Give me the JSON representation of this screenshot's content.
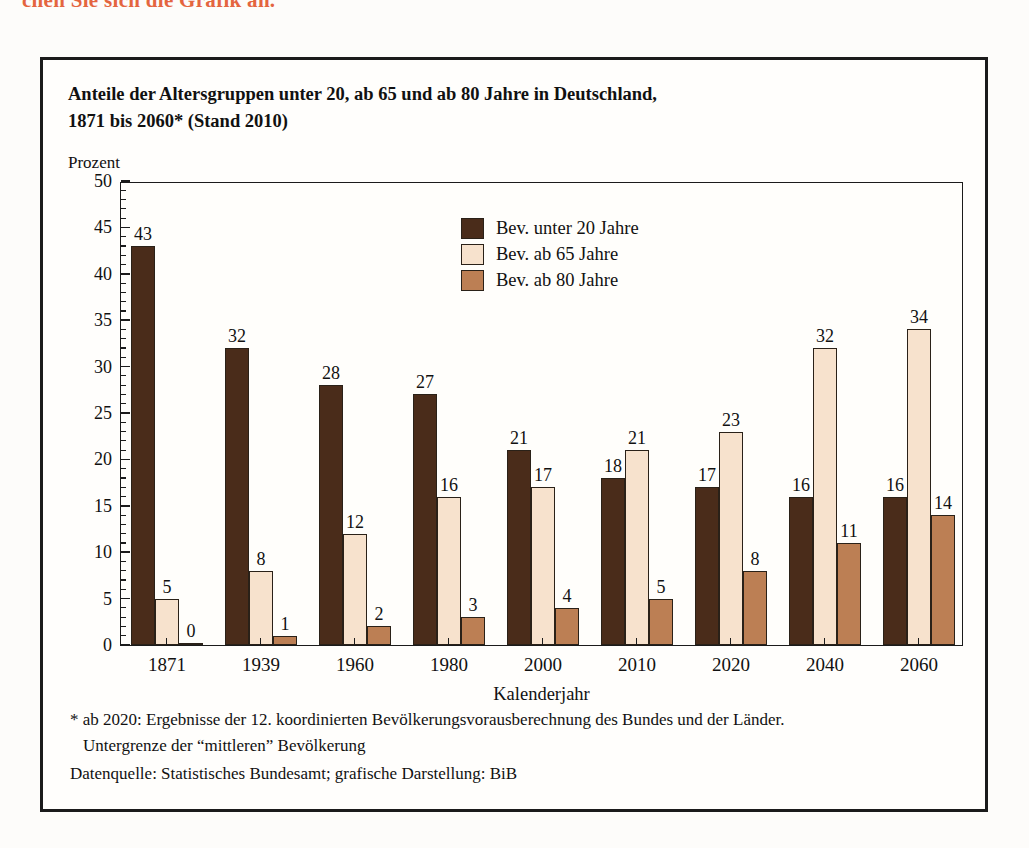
{
  "top_heading": "chen Sie sich die Grafik an.",
  "figure": {
    "title_line1": "Anteile der Altersgruppen unter 20, ab 65 und ab 80 Jahre in Deutschland,",
    "title_line2": "1871 bis 2060* (Stand 2010)",
    "y_unit_label": "Prozent",
    "x_axis_title": "Kalenderjahr",
    "note_line1": "* ab 2020: Ergebnisse der 12. koordinierten Bevölkerungsvorausberechnung des Bundes und der Länder.",
    "note_line2": "Untergrenze der “mittleren” Bevölkerung",
    "note_source": "Datenquelle: Statistisches Bundesamt; grafische Darstellung: BiB"
  },
  "chart_data": {
    "type": "bar",
    "title": "Anteile der Altersgruppen unter 20, ab 65 und ab 80 Jahre in Deutschland, 1871 bis 2060* (Stand 2010)",
    "xlabel": "Kalenderjahr",
    "ylabel": "Prozent",
    "ylim": [
      0,
      50
    ],
    "ytick_step": 5,
    "yminor_step": 1,
    "grid": false,
    "legend_position": "inside-top-center",
    "categories": [
      "1871",
      "1939",
      "1960",
      "1980",
      "2000",
      "2010",
      "2020",
      "2040",
      "2060"
    ],
    "series": [
      {
        "name": "Bev. unter 20 Jahre",
        "color": "#4a2c1a",
        "values": [
          43,
          32,
          28,
          27,
          21,
          18,
          17,
          16,
          16
        ]
      },
      {
        "name": "Bev. ab 65 Jahre",
        "color": "#f7e2cd",
        "values": [
          5,
          8,
          12,
          16,
          17,
          21,
          23,
          32,
          34
        ]
      },
      {
        "name": "Bev. ab 80 Jahre",
        "color": "#bc7f54",
        "values": [
          0,
          1,
          2,
          3,
          4,
          5,
          8,
          11,
          14
        ]
      }
    ],
    "ytick_labels": [
      "0",
      "5",
      "10",
      "15",
      "20",
      "25",
      "30",
      "35",
      "40",
      "45",
      "50"
    ]
  }
}
